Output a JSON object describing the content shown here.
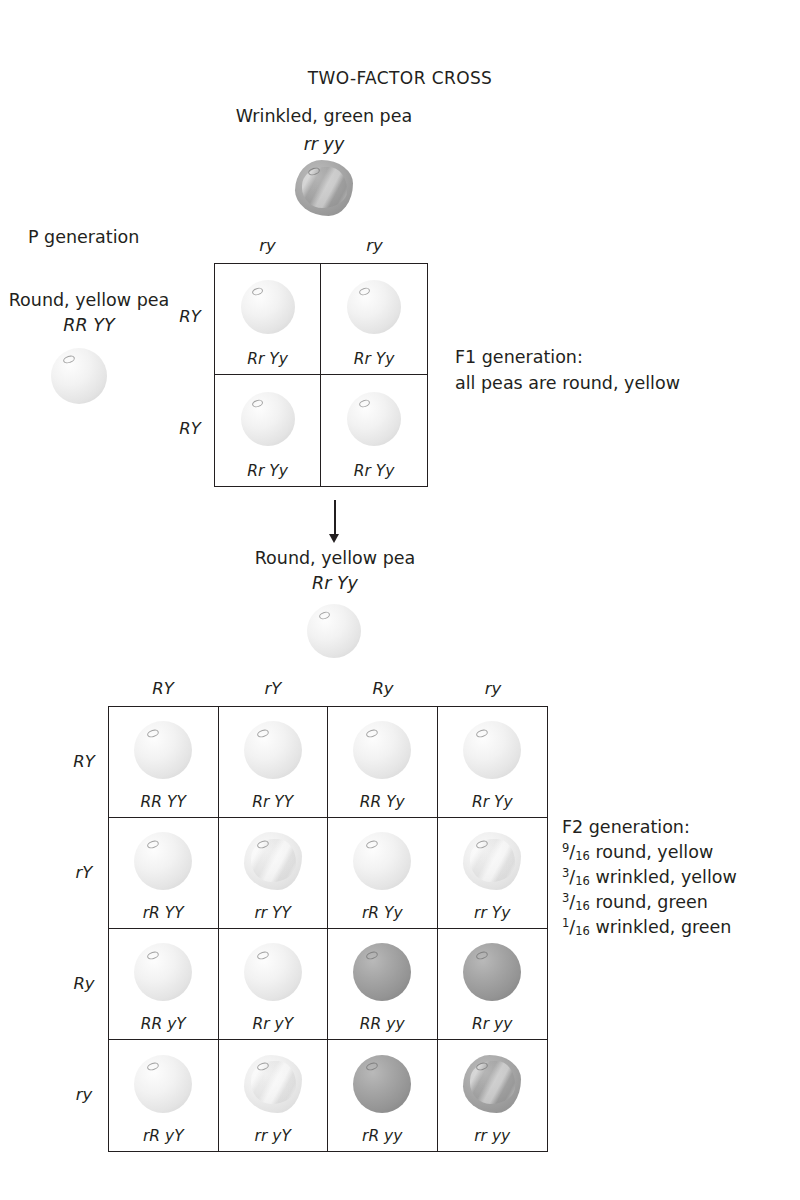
{
  "title": "TWO-FACTOR CROSS",
  "parents": {
    "top": {
      "phenotype": "Wrinkled, green pea",
      "genotype": "rr yy",
      "pea": "wrinkled-green-pea"
    },
    "left": {
      "generation_label": "P generation",
      "phenotype": "Round, yellow pea",
      "genotype": "RR YY",
      "pea": "round-yellow-pea"
    }
  },
  "cross1": {
    "col_headers": [
      "ry",
      "ry"
    ],
    "row_headers": [
      "RY",
      "RY"
    ],
    "cells": [
      {
        "genotype": "Rr Yy",
        "pea": "round-yellow-pea"
      },
      {
        "genotype": "Rr Yy",
        "pea": "round-yellow-pea"
      },
      {
        "genotype": "Rr Yy",
        "pea": "round-yellow-pea"
      },
      {
        "genotype": "Rr Yy",
        "pea": "round-yellow-pea"
      }
    ],
    "caption": {
      "line1": "F1 generation:",
      "line2": "all peas are round, yellow"
    }
  },
  "f1_offspring": {
    "phenotype": "Round, yellow pea",
    "genotype": "Rr Yy",
    "pea": "round-yellow-pea"
  },
  "cross2": {
    "col_headers": [
      "RY",
      "rY",
      "Ry",
      "ry"
    ],
    "row_headers": [
      "RY",
      "rY",
      "Ry",
      "ry"
    ],
    "cells": [
      {
        "genotype": "RR YY",
        "pea": "round-yellow-pea"
      },
      {
        "genotype": "Rr YY",
        "pea": "round-yellow-pea"
      },
      {
        "genotype": "RR Yy",
        "pea": "round-yellow-pea"
      },
      {
        "genotype": "Rr Yy",
        "pea": "round-yellow-pea"
      },
      {
        "genotype": "rR YY",
        "pea": "round-yellow-pea"
      },
      {
        "genotype": "rr YY",
        "pea": "wrinkled-yellow-pea"
      },
      {
        "genotype": "rR Yy",
        "pea": "round-yellow-pea"
      },
      {
        "genotype": "rr Yy",
        "pea": "wrinkled-yellow-pea"
      },
      {
        "genotype": "RR yY",
        "pea": "round-yellow-pea"
      },
      {
        "genotype": "Rr yY",
        "pea": "round-yellow-pea"
      },
      {
        "genotype": "RR yy",
        "pea": "round-green-pea"
      },
      {
        "genotype": "Rr yy",
        "pea": "round-green-pea"
      },
      {
        "genotype": "rR yY",
        "pea": "round-yellow-pea"
      },
      {
        "genotype": "rr yY",
        "pea": "wrinkled-yellow-pea"
      },
      {
        "genotype": "rR yy",
        "pea": "round-green-pea"
      },
      {
        "genotype": "rr yy",
        "pea": "wrinkled-green-pea"
      }
    ],
    "caption": {
      "heading": "F2 generation:",
      "ratios": [
        {
          "numerator": "9",
          "denominator": "16",
          "phenotype": "round, yellow"
        },
        {
          "numerator": "3",
          "denominator": "16",
          "phenotype": "wrinkled, yellow"
        },
        {
          "numerator": "3",
          "denominator": "16",
          "phenotype": "round, green"
        },
        {
          "numerator": "1",
          "denominator": "16",
          "phenotype": "wrinkled, green"
        }
      ]
    }
  },
  "colors": {
    "ink": "#231f20",
    "yellow_pea": "#ebebeb",
    "green_pea": "#9a9a9a",
    "background": "#ffffff"
  }
}
